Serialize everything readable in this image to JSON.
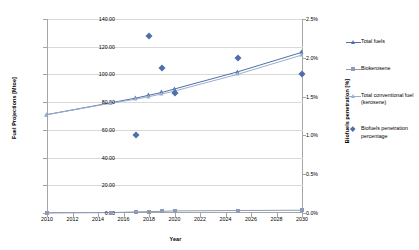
{
  "chart_data": {
    "type": "line",
    "title": "",
    "xlabel": "Year",
    "ylabel": "Fuel Projections [Mtoe]",
    "ylabel_right": "Biofuels penetration [%]",
    "xlim": [
      2010,
      2030
    ],
    "ylim": [
      0,
      140
    ],
    "ylim_right": [
      0,
      2.5
    ],
    "grid": true,
    "legend_position": "right",
    "xticks": [
      "2010",
      "2012",
      "2014",
      "2016",
      "2018",
      "2020",
      "2022",
      "2024",
      "2026",
      "2028",
      "2030"
    ],
    "yticks_left": [
      "0.00",
      "20.00",
      "40.00",
      "60.00",
      "80.00",
      "100.00",
      "120.00",
      "140.00"
    ],
    "yticks_right": [
      "0.0%",
      "0.5%",
      "1.0%",
      "1.5%",
      "2.0%",
      "2.5%"
    ],
    "series": [
      {
        "name": "Total fuels",
        "axis": "left",
        "color": "#4f6fa8",
        "marker": "triangle",
        "x": [
          2010,
          2015,
          2017,
          2018,
          2019,
          2020,
          2025,
          2030
        ],
        "values": [
          71.0,
          79.5,
          83.0,
          85.0,
          87.0,
          89.5,
          102.0,
          116.0
        ]
      },
      {
        "name": "Biokerosene",
        "axis": "left",
        "color": "#8d9bb5",
        "marker": "square",
        "x": [
          2010,
          2015,
          2017,
          2018,
          2019,
          2020,
          2025,
          2030
        ],
        "values": [
          0.0,
          0.3,
          0.8,
          1.0,
          1.2,
          1.5,
          1.8,
          2.0
        ]
      },
      {
        "name": "Total conventional fuel (kerosene)",
        "axis": "left",
        "color": "#9bb0cf",
        "marker": "triangle",
        "x": [
          2010,
          2015,
          2017,
          2018,
          2019,
          2020,
          2025,
          2030
        ],
        "values": [
          71.0,
          79.2,
          82.2,
          84.0,
          85.8,
          88.0,
          100.2,
          114.0
        ]
      },
      {
        "name": "Biofuels penetration percentage",
        "axis": "right",
        "color": "#4f6fa8",
        "marker": "diamond",
        "x": [
          2017,
          2018,
          2019,
          2020,
          2025,
          2030
        ],
        "values": [
          1.0,
          2.28,
          1.87,
          1.55,
          2.0,
          1.79
        ]
      }
    ]
  },
  "legend": {
    "items": [
      {
        "label": "Total fuels"
      },
      {
        "label": "Biokerosene"
      },
      {
        "label": "Total conventional fuel (kerosene)"
      },
      {
        "label": "Biofuels penetration percentage"
      }
    ]
  }
}
